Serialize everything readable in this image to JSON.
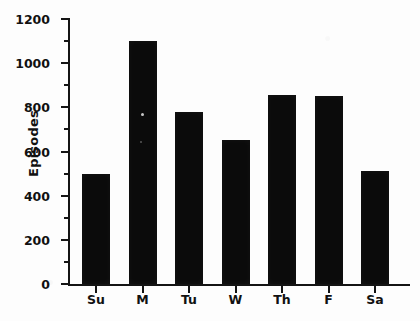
{
  "chart_data": {
    "type": "bar",
    "title": "",
    "xlabel": "",
    "ylabel": "Episodes",
    "categories": [
      "Su",
      "M",
      "Tu",
      "W",
      "Th",
      "F",
      "Sa"
    ],
    "values": [
      500,
      1100,
      780,
      650,
      855,
      850,
      510
    ],
    "ylim": [
      0,
      1200
    ],
    "ytick_labels": [
      "0",
      "200",
      "400",
      "600",
      "800",
      "1000",
      "1200"
    ],
    "ytick_values": [
      0,
      200,
      400,
      600,
      800,
      1000,
      1200
    ],
    "minor_tick_interval": 100,
    "grid": false,
    "legend": false,
    "bar_color": "#0b0b0b",
    "axis_color": "#141414",
    "background_color": "#ffffff",
    "series": [
      {
        "name": "Episodes",
        "values": [
          500,
          1100,
          780,
          650,
          855,
          850,
          510
        ]
      }
    ]
  }
}
